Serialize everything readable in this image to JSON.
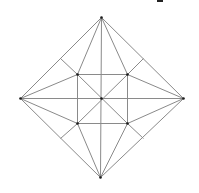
{
  "diagram": {
    "colors": {
      "line": "#8a8a8a",
      "vertex": "#1a1a1a",
      "background": "#ffffff"
    },
    "points": {
      "T": [
        101,
        17
      ],
      "L": [
        20,
        98
      ],
      "R": [
        183,
        98
      ],
      "B": [
        100,
        177
      ],
      "C": [
        101,
        98
      ],
      "I1": [
        77,
        74
      ],
      "I2": [
        127,
        74
      ],
      "I3": [
        77,
        123
      ],
      "I4": [
        127,
        123
      ],
      "M1": [
        60,
        58
      ],
      "M2": [
        143,
        58
      ],
      "M3": [
        60,
        138
      ],
      "M4": [
        143,
        138
      ]
    },
    "segments": [
      [
        "T",
        "R"
      ],
      [
        "R",
        "B"
      ],
      [
        "B",
        "L"
      ],
      [
        "L",
        "T"
      ],
      [
        "T",
        "B"
      ],
      [
        "L",
        "R"
      ],
      [
        "I1",
        "I2"
      ],
      [
        "I2",
        "I4"
      ],
      [
        "I4",
        "I3"
      ],
      [
        "I3",
        "I1"
      ],
      [
        "I1",
        "I4"
      ],
      [
        "I2",
        "I3"
      ],
      [
        "T",
        "I1"
      ],
      [
        "T",
        "I2"
      ],
      [
        "B",
        "I3"
      ],
      [
        "B",
        "I4"
      ],
      [
        "L",
        "I1"
      ],
      [
        "L",
        "I3"
      ],
      [
        "R",
        "I2"
      ],
      [
        "R",
        "I4"
      ],
      [
        "M1",
        "I1"
      ],
      [
        "M2",
        "I2"
      ],
      [
        "M3",
        "I3"
      ],
      [
        "M4",
        "I4"
      ]
    ],
    "vertices": [
      "T",
      "L",
      "R",
      "B",
      "C",
      "I1",
      "I2",
      "I3",
      "I4"
    ]
  }
}
